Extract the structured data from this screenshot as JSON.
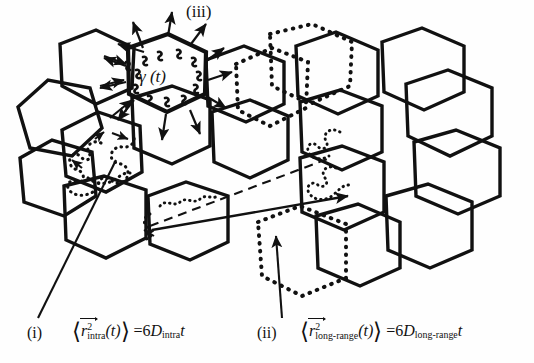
{
  "figure": {
    "domain_type": "scientific-diagram",
    "caption_labels": {
      "iii": "(iii)",
      "i": "(i)",
      "ii": "(ii)"
    },
    "gamma_label": "γ (t)",
    "equations": {
      "intra": {
        "lhs_open": "⟨",
        "symbol": "r",
        "exponent": "2",
        "subscript": "intra",
        "argument": "(t)",
        "lhs_close": "⟩",
        "equals": "=",
        "coefficient": "6",
        "diffusion_symbol": "D",
        "diffusion_subscript": "intra",
        "time": "t",
        "plain": "⟨r⃗²_intra(t)⟩ = 6D_intra t"
      },
      "long_range": {
        "lhs_open": "⟨",
        "symbol": "r",
        "exponent": "2",
        "subscript": "long-range",
        "argument": "(t)",
        "lhs_close": "⟩",
        "equals": "=",
        "coefficient": "6",
        "diffusion_symbol": "D",
        "diffusion_subscript": "long-range",
        "time": "t",
        "plain": "⟨r⃗²_long-range(t)⟩ = 6D_long-range t"
      }
    },
    "colors": {
      "stroke": "#111111",
      "background": "#fefefe",
      "dotted": "#111111"
    },
    "elements": {
      "solid_hexagons_count": 16,
      "dotted_hexagons_count": 3,
      "intra_trajectory": "confined dotted random walk inside single hexagonal domain",
      "long_range_trajectory": "solid arrow spanning many domains",
      "dashed_guide": "dashed line from left domain to right domain",
      "boundary_squiggles": "wavy gamma(t) boundary fluctuation marks on central hexagon",
      "radiating_arrows_count": 12
    }
  }
}
